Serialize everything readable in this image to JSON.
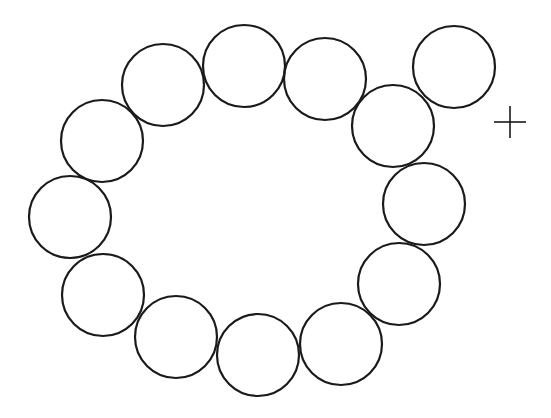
{
  "diagram": {
    "stroke_color": "#1a1a1a",
    "background": "#ffffff",
    "circle_radius": 41,
    "stroke_width": 2.2,
    "circles": [
      {
        "id": "circle-1",
        "cx": 70,
        "cy": 217
      },
      {
        "id": "circle-2",
        "cx": 102,
        "cy": 141
      },
      {
        "id": "circle-3",
        "cx": 163,
        "cy": 85
      },
      {
        "id": "circle-4",
        "cx": 244,
        "cy": 66
      },
      {
        "id": "circle-5",
        "cx": 325,
        "cy": 79
      },
      {
        "id": "circle-6",
        "cx": 393,
        "cy": 126
      },
      {
        "id": "circle-7",
        "cx": 454,
        "cy": 67
      },
      {
        "id": "circle-8",
        "cx": 424,
        "cy": 204
      },
      {
        "id": "circle-9",
        "cx": 399,
        "cy": 284
      },
      {
        "id": "circle-10",
        "cx": 341,
        "cy": 344
      },
      {
        "id": "circle-11",
        "cx": 258,
        "cy": 355
      },
      {
        "id": "circle-12",
        "cx": 176,
        "cy": 337
      },
      {
        "id": "circle-13",
        "cx": 103,
        "cy": 295
      }
    ],
    "crosshair": {
      "cx": 510,
      "cy": 122,
      "half_length": 16,
      "stroke_width": 1.6
    }
  }
}
